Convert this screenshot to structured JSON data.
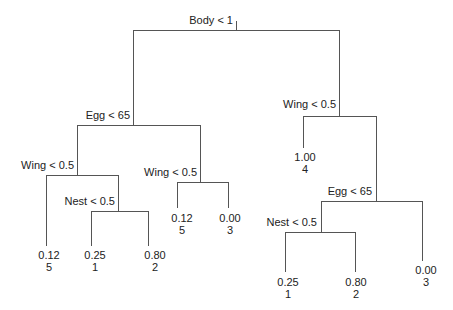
{
  "diagram": {
    "type": "regression-tree",
    "nodes": {
      "root": {
        "split": "Body < 1"
      },
      "left": {
        "split": "Egg < 65"
      },
      "left_left": {
        "split": "Wing < 0.5"
      },
      "left_left_right": {
        "split": "Nest < 0.5"
      },
      "left_right": {
        "split": "Wing < 0.5"
      },
      "right": {
        "split": "Wing < 0.5"
      },
      "right_right": {
        "split": "Egg < 65"
      },
      "right_right_left": {
        "split": "Nest < 0.5"
      }
    },
    "leaves": {
      "l1": {
        "value": "0.12",
        "n": "5"
      },
      "l2": {
        "value": "0.25",
        "n": "1"
      },
      "l3": {
        "value": "0.80",
        "n": "2"
      },
      "l4": {
        "value": "0.12",
        "n": "5"
      },
      "l5": {
        "value": "0.00",
        "n": "3"
      },
      "r1": {
        "value": "1.00",
        "n": "4"
      },
      "r2": {
        "value": "0.25",
        "n": "1"
      },
      "r3": {
        "value": "0.80",
        "n": "2"
      },
      "r4": {
        "value": "0.00",
        "n": "3"
      }
    }
  }
}
